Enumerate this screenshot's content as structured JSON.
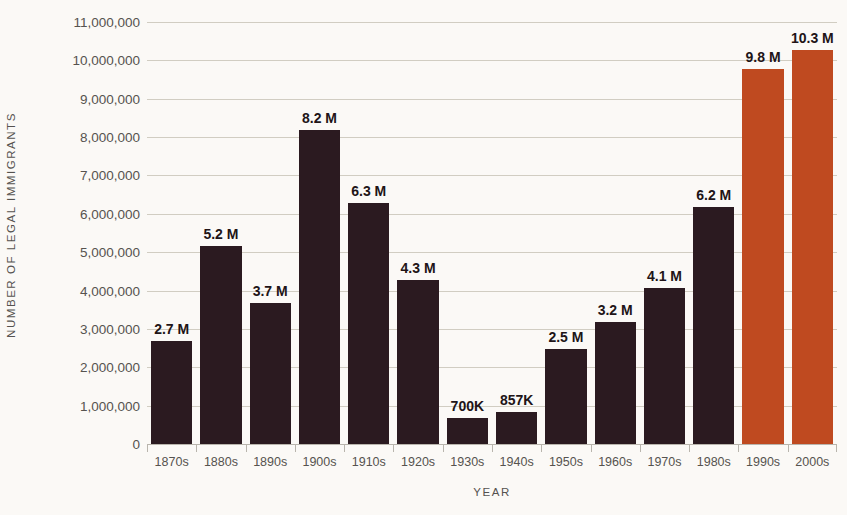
{
  "chart_data": {
    "type": "bar",
    "title": "",
    "xlabel": "YEAR",
    "ylabel": "NUMBER OF LEGAL IMMIGRANTS",
    "categories": [
      "1870s",
      "1880s",
      "1890s",
      "1900s",
      "1910s",
      "1920s",
      "1930s",
      "1940s",
      "1950s",
      "1960s",
      "1970s",
      "1980s",
      "1990s",
      "2000s"
    ],
    "values": [
      2700000,
      5200000,
      3700000,
      8200000,
      6300000,
      4300000,
      700000,
      857000,
      2500000,
      3200000,
      4100000,
      6200000,
      9800000,
      10300000
    ],
    "data_labels": [
      "2.7 M",
      "5.2 M",
      "3.7 M",
      "8.2 M",
      "6.3 M",
      "4.3 M",
      "700K",
      "857K",
      "2.5 M",
      "3.2 M",
      "4.1 M",
      "6.2 M",
      "9.8 M",
      "10.3 M"
    ],
    "bar_colors": [
      "#2b1a20",
      "#2b1a20",
      "#2b1a20",
      "#2b1a20",
      "#2b1a20",
      "#2b1a20",
      "#2b1a20",
      "#2b1a20",
      "#2b1a20",
      "#2b1a20",
      "#2b1a20",
      "#2b1a20",
      "#bf4a20",
      "#bf4a20"
    ],
    "ylim": [
      0,
      11000000
    ],
    "ytick_values": [
      0,
      1000000,
      2000000,
      3000000,
      4000000,
      5000000,
      6000000,
      7000000,
      8000000,
      9000000,
      10000000,
      11000000
    ],
    "ytick_labels": [
      "0",
      "1,000,000",
      "2,000,000",
      "3,000,000",
      "4,000,000",
      "5,000,000",
      "6,000,000",
      "7,000,000",
      "8,000,000",
      "9,000,000",
      "10,000,000",
      "11,000,000"
    ],
    "grid": true,
    "legend": false,
    "legend_position": "none",
    "background_color": "#fbf9f6",
    "gridline_color": "#cfcabf",
    "axis_color": "#b9b5ad",
    "label_color": "#56534f",
    "value_label_color": "#211417",
    "accent_color": "#bf4a20",
    "primary_color": "#2b1a20"
  },
  "footer": {
    "source_sliver": ""
  }
}
